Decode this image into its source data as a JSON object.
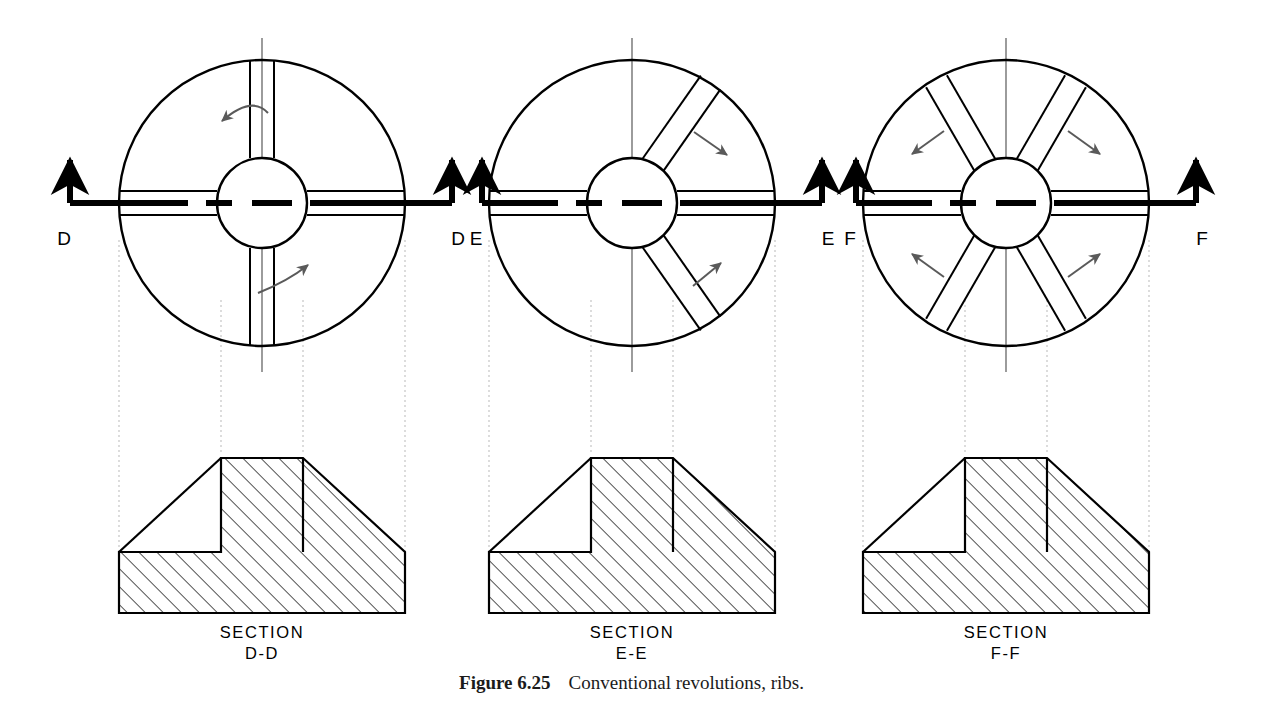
{
  "figure": {
    "label": "Figure 6.25",
    "caption_text": "Conventional revolutions, ribs.",
    "domain": "engineering-drawing"
  },
  "colors": {
    "ink": "#000000",
    "arrow_gray": "#5a5a5a",
    "projection_line": "#b9b9b9",
    "hatch": "#1a1a1a",
    "paper": "#ffffff"
  },
  "views": [
    {
      "id": "d",
      "cut_letter_left": "D",
      "cut_letter_right": "D",
      "section_word": "SECTION",
      "section_id": "D-D",
      "rib_count": 4,
      "rib_arrangement": "four ribs at 90 degrees (cross / plus)",
      "rib_angles_deg": [
        0,
        90,
        180,
        270
      ],
      "revolution_arrow_style": "curved",
      "revolution_arrow_count": 2,
      "center_x": 262,
      "center_y": 203,
      "radius": 143,
      "hub_radius": 45,
      "rib_half_width": 12
    },
    {
      "id": "e",
      "cut_letter_left": "E",
      "cut_letter_right": "E",
      "section_word": "SECTION",
      "section_id": "E-E",
      "rib_count": 4,
      "rib_arrangement": "two horizontal ribs plus two diagonal ribs revolved into the cutting plane",
      "rib_angles_deg": [
        0,
        55,
        180,
        305
      ],
      "revolution_arrow_style": "straight",
      "revolution_arrow_count": 2,
      "center_x": 632,
      "center_y": 203,
      "radius": 143,
      "hub_radius": 45,
      "rib_half_width": 12
    },
    {
      "id": "f",
      "cut_letter_left": "F",
      "cut_letter_right": "F",
      "section_word": "SECTION",
      "section_id": "F-F",
      "rib_count": 6,
      "rib_arrangement": "six ribs at 60 degrees",
      "rib_angles_deg": [
        0,
        60,
        120,
        180,
        240,
        300
      ],
      "revolution_arrow_style": "straight",
      "revolution_arrow_count": 4,
      "center_x": 1006,
      "center_y": 203,
      "radius": 143,
      "hub_radius": 45,
      "rib_half_width": 12
    }
  ],
  "section_profile": {
    "description": "T-shaped sectioned profile: rectangular base slab, central vertical rib, sloping flanks from rib top to slab top",
    "hatch_angle_deg": 45,
    "hatch_spacing_px": 9,
    "base_left_offset": -143,
    "base_right_offset": 143,
    "rib_left_offset": -41,
    "rib_right_offset": 41,
    "base_top_offset": 104,
    "base_bottom_offset": 165,
    "rib_top_offset": 10
  },
  "annotations": {
    "cutting_plane_style": "thick dashed cutting-plane line with upward viewing arrows at both ends",
    "projection_line_style": "light dotted projection lines from circular view to section view"
  }
}
